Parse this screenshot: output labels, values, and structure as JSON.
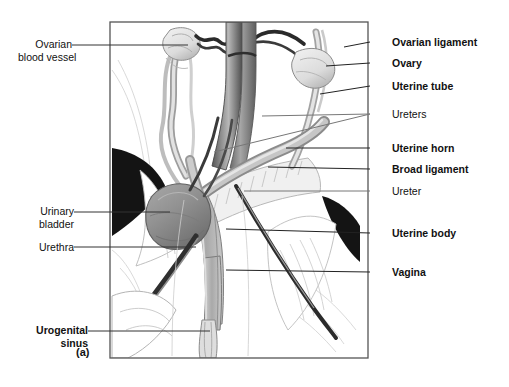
{
  "figure": {
    "panel_label": "(a)",
    "title_implied": "Female reproductive tract, ventral view",
    "frame": {
      "x": 110,
      "y": 22,
      "width": 258,
      "height": 336,
      "border_color": "#555555"
    }
  },
  "labels_left": [
    {
      "id": "ovarian-blood-vessel",
      "text": "Ovarian\nblood vessel",
      "bold": false,
      "x": 18,
      "y": 38,
      "leader_color": "#333333"
    },
    {
      "id": "urinary-bladder",
      "text": "Urinary\nbladder",
      "bold": false,
      "x": 27,
      "y": 205,
      "leader_color": "#333333"
    },
    {
      "id": "urethra",
      "text": "Urethra",
      "bold": false,
      "x": 27,
      "y": 242,
      "leader_color": "#333333"
    },
    {
      "id": "urogenital-sinus",
      "text": "Urogenital\nsinus",
      "bold": true,
      "x": 22,
      "y": 324,
      "leader_color": "#333333"
    }
  ],
  "labels_right": [
    {
      "id": "ovarian-ligament",
      "text": "Ovarian ligament",
      "bold": true,
      "x": 392,
      "y": 36,
      "leader_color": "#222222"
    },
    {
      "id": "ovary",
      "text": "Ovary",
      "bold": true,
      "x": 392,
      "y": 58,
      "leader_color": "#222222"
    },
    {
      "id": "uterine-tube",
      "text": "Uterine tube",
      "bold": true,
      "x": 392,
      "y": 81,
      "leader_color": "#222222"
    },
    {
      "id": "ureters",
      "text": "Ureters",
      "bold": false,
      "x": 392,
      "y": 110,
      "leader_color": "#777777"
    },
    {
      "id": "uterine-horn",
      "text": "Uterine horn",
      "bold": true,
      "x": 392,
      "y": 143,
      "leader_color": "#222222"
    },
    {
      "id": "broad-ligament",
      "text": "Broad ligament",
      "bold": true,
      "x": 392,
      "y": 164,
      "leader_color": "#222222"
    },
    {
      "id": "ureter",
      "text": "Ureter",
      "bold": false,
      "x": 392,
      "y": 186,
      "leader_color": "#777777"
    },
    {
      "id": "uterine-body",
      "text": "Uterine body",
      "bold": true,
      "x": 392,
      "y": 228,
      "leader_color": "#222222"
    },
    {
      "id": "vagina",
      "text": "Vagina",
      "bold": true,
      "x": 392,
      "y": 267,
      "leader_color": "#222222"
    }
  ],
  "palette": {
    "background": "#ffffff",
    "frame_border": "#555555",
    "vessel_dark": "#4a4a4a",
    "vessel_mid": "#6f6f6f",
    "vessel_highlight": "#b9b9b9",
    "organ_pale": "#e9e9e9",
    "organ_light": "#dcdcdc",
    "bladder_gray": "#9a9a9a",
    "bladder_shadow": "#777777",
    "tube_gray": "#c2c2c2",
    "tissue_black": "#141414",
    "outline": "#3c3c3c",
    "hatch": "#b5b5b5"
  },
  "structures": [
    {
      "name": "ovary-left",
      "fill": "organ_pale"
    },
    {
      "name": "ovary-right",
      "fill": "organ_pale"
    },
    {
      "name": "uterine-tube-left",
      "fill": "organ_light"
    },
    {
      "name": "uterine-tube-right",
      "fill": "organ_light"
    },
    {
      "name": "ovarian-blood-vessel",
      "fill": "tissue_black"
    },
    {
      "name": "aorta",
      "fill": "vessel_dark"
    },
    {
      "name": "caudal-vena-cava",
      "fill": "vessel_mid"
    },
    {
      "name": "uterine-horn-right",
      "fill": "tube_gray"
    },
    {
      "name": "uterine-horn-left",
      "fill": "tube_gray"
    },
    {
      "name": "broad-ligament",
      "fill": "hatch"
    },
    {
      "name": "uterine-body",
      "fill": "tube_gray"
    },
    {
      "name": "vagina",
      "fill": "tube_gray"
    },
    {
      "name": "urogenital-sinus",
      "fill": "organ_light"
    },
    {
      "name": "urinary-bladder",
      "fill": "bladder_gray"
    },
    {
      "name": "urethra",
      "fill": "vessel_dark"
    },
    {
      "name": "ureter-left",
      "fill": "vessel_dark"
    },
    {
      "name": "ureter-right",
      "fill": "vessel_dark"
    },
    {
      "name": "body-wall-wedge-left",
      "fill": "tissue_black"
    },
    {
      "name": "body-wall-wedge-right",
      "fill": "tissue_black"
    }
  ]
}
